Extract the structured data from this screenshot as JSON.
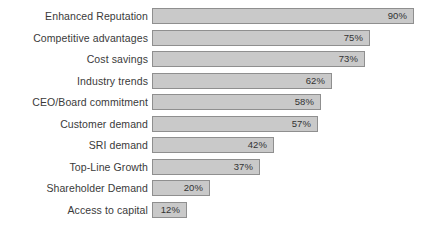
{
  "chart_data": {
    "type": "bar",
    "orientation": "horizontal",
    "title": "",
    "subtitle": "",
    "xlabel": "",
    "ylabel": "",
    "xlim": [
      0,
      100
    ],
    "grid": false,
    "legend": null,
    "value_suffix": "%",
    "categories": [
      "Enhanced Reputation",
      "Competitive advantages",
      "Cost savings",
      "Industry trends",
      "CEO/Board commitment",
      "Customer demand",
      "SRI demand",
      "Top-Line Growth",
      "Shareholder Demand",
      "Access to capital"
    ],
    "values": [
      90,
      75,
      73,
      62,
      58,
      57,
      42,
      37,
      20,
      12
    ],
    "data_labels": [
      "90%",
      "75%",
      "73%",
      "62%",
      "58%",
      "57%",
      "42%",
      "37%",
      "20%",
      "12%"
    ],
    "colors": {
      "bar_fill": "#c9c9c9",
      "bar_border": "#8f8f8f",
      "label_text": "#3a3a3a",
      "value_text": "#333333",
      "background": "#ffffff"
    }
  }
}
